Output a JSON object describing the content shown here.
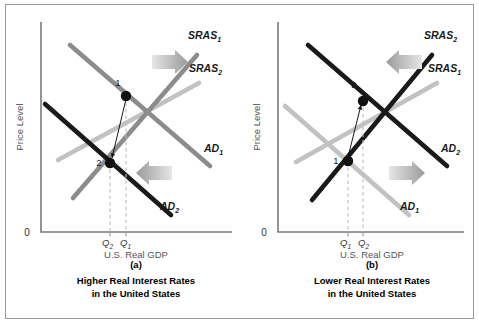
{
  "figure": {
    "width": 479,
    "height": 324,
    "background": "#ffffff",
    "border_color": "#9a9a9a"
  },
  "colors": {
    "near_black": "#1a1a1a",
    "dark_gray": "#4f4f4f",
    "mid_gray": "#8c8c8c",
    "light_gray": "#c2c2c2",
    "axis": "#7a7a7a",
    "guide": "#bdbdbd",
    "point": "#111111",
    "arrow_light": "#e2e2e2",
    "arrow_dark": "#9e9e9e"
  },
  "chart_data": [
    {
      "type": "line",
      "id": "panel-a",
      "title": "Higher Real Interest Rates in the United States",
      "panel_label": "(a)",
      "xlabel": "U.S. Real GDP",
      "ylabel": "Price Level",
      "origin_label": "0",
      "grid": false,
      "legend": "inline-curve-labels",
      "axis_origin_px": {
        "x": 41,
        "y": 232
      },
      "plot_box_px": {
        "x0": 41,
        "y0": 22,
        "x1": 232,
        "y1": 232
      },
      "series": [
        {
          "name": "SRAS1",
          "label": "SRAS",
          "sub": "1",
          "color": "#8c8c8c",
          "width": 4.6,
          "slope": "upward",
          "points_px": [
            [
              73,
              198
            ],
            [
              197,
              55
            ]
          ],
          "label_px": [
            188,
            39
          ]
        },
        {
          "name": "SRAS2",
          "label": "SRAS",
          "sub": "2",
          "color": "#c2c2c2",
          "width": 4.6,
          "slope": "upward",
          "points_px": [
            [
              58,
              160
            ],
            [
              199,
              83
            ]
          ],
          "label_px": [
            189,
            72
          ]
        },
        {
          "name": "AD1",
          "label": "AD",
          "sub": "1",
          "color": "#8c8c8c",
          "width": 4.6,
          "slope": "downward",
          "points_px": [
            [
              70,
              45
            ],
            [
              210,
              166
            ]
          ],
          "label_px": [
            204,
            152
          ]
        },
        {
          "name": "AD2",
          "label": "AD",
          "sub": "2",
          "color": "#1a1a1a",
          "width": 4.6,
          "slope": "downward",
          "points_px": [
            [
              45,
              104
            ],
            [
              171,
              215
            ]
          ],
          "label_px": [
            160,
            210
          ]
        }
      ],
      "equilibria": [
        {
          "label": "1",
          "x_px": 126,
          "y_px": 96,
          "label_px": [
            118,
            86
          ]
        },
        {
          "label": "2",
          "x_px": 110,
          "y_px": 163,
          "label_px": [
            99,
            166
          ]
        }
      ],
      "quantity_ticks": [
        {
          "label": "Q",
          "sub": "2",
          "x_px": 110,
          "text_px": [
            102,
            246
          ]
        },
        {
          "label": "Q",
          "sub": "1",
          "x_px": 126,
          "text_px": [
            120,
            246
          ]
        }
      ],
      "movement_arrow": {
        "from_px": [
          126,
          99
        ],
        "to_px": [
          112,
          158
        ]
      },
      "shift_arrows": [
        {
          "name": "sras-shift-right",
          "direction": "right",
          "x_px": 152,
          "y_px": 62,
          "length": 36,
          "color_from": "#d8d8d8",
          "color_to": "#9e9e9e"
        },
        {
          "name": "ad-shift-left",
          "direction": "left",
          "x_px": 136,
          "y_px": 173,
          "length": 36,
          "color_from": "#d8d8d8",
          "color_to": "#9e9e9e"
        }
      ]
    },
    {
      "type": "line",
      "id": "panel-b",
      "title": "Lower Real Interest Rates in the United States",
      "panel_label": "(b)",
      "xlabel": "U.S. Real GDP",
      "ylabel": "Price Level",
      "origin_label": "0",
      "grid": false,
      "legend": "inline-curve-labels",
      "axis_origin_px": {
        "x": 278,
        "y": 232
      },
      "plot_box_px": {
        "x0": 278,
        "y0": 22,
        "x1": 464,
        "y1": 232
      },
      "series": [
        {
          "name": "SRAS2",
          "label": "SRAS",
          "sub": "2",
          "color": "#1a1a1a",
          "width": 4.6,
          "slope": "upward",
          "points_px": [
            [
              312,
              200
            ],
            [
              432,
              55
            ]
          ],
          "label_px": [
            424,
            39
          ]
        },
        {
          "name": "SRAS1",
          "label": "SRAS",
          "sub": "1",
          "color": "#c2c2c2",
          "width": 4.6,
          "slope": "upward",
          "points_px": [
            [
              296,
              162
            ],
            [
              437,
              83
            ]
          ],
          "label_px": [
            428,
            72
          ]
        },
        {
          "name": "AD1",
          "label": "AD",
          "sub": "1",
          "color": "#c2c2c2",
          "width": 4.6,
          "slope": "downward",
          "points_px": [
            [
              285,
              106
            ],
            [
              409,
              215
            ]
          ],
          "label_px": [
            400,
            210
          ]
        },
        {
          "name": "AD2",
          "label": "AD",
          "sub": "2",
          "color": "#1a1a1a",
          "width": 4.6,
          "slope": "downward",
          "points_px": [
            [
              308,
              45
            ],
            [
              447,
              166
            ]
          ],
          "label_px": [
            441,
            152
          ]
        }
      ],
      "equilibria": [
        {
          "label": "2",
          "x_px": 363,
          "y_px": 101,
          "label_px": [
            354,
            88
          ]
        },
        {
          "label": "1",
          "x_px": 348,
          "y_px": 161,
          "label_px": [
            336,
            164
          ]
        }
      ],
      "quantity_ticks": [
        {
          "label": "Q",
          "sub": "1",
          "x_px": 348,
          "text_px": [
            340,
            246
          ]
        },
        {
          "label": "Q",
          "sub": "2",
          "x_px": 363,
          "text_px": [
            358,
            246
          ]
        }
      ],
      "movement_arrow": {
        "from_px": [
          348,
          157
        ],
        "to_px": [
          361,
          105
        ]
      },
      "shift_arrows": [
        {
          "name": "sras-shift-left",
          "direction": "left",
          "x_px": 386,
          "y_px": 62,
          "length": 36,
          "color_from": "#d8d8d8",
          "color_to": "#9e9e9e"
        },
        {
          "name": "ad-shift-right",
          "direction": "right",
          "x_px": 389,
          "y_px": 173,
          "length": 36,
          "color_from": "#d8d8d8",
          "color_to": "#9e9e9e"
        }
      ]
    }
  ],
  "panels": [
    {
      "id": "a",
      "panel_label": "(a)",
      "caption_line1": "Higher Real Interest Rates",
      "caption_line2": "in the United States",
      "xlabel": "U.S. Real GDP",
      "ylabel": "Price Level",
      "origin_label": "0",
      "panel_label_px": [
        136,
        268
      ],
      "caption1_px": [
        136,
        284
      ],
      "caption2_px": [
        136,
        297
      ],
      "xlabel_px": [
        136,
        258
      ],
      "ylabel_px": [
        23,
        127
      ],
      "origin_px": [
        27,
        236
      ]
    },
    {
      "id": "b",
      "panel_label": "(b)",
      "caption_line1": "Lower Real Interest Rates",
      "caption_line2": "in the United States",
      "xlabel": "U.S. Real GDP",
      "ylabel": "Price Level",
      "origin_label": "0",
      "panel_label_px": [
        372,
        268
      ],
      "caption1_px": [
        372,
        284
      ],
      "caption2_px": [
        372,
        297
      ],
      "xlabel_px": [
        372,
        258
      ],
      "ylabel_px": [
        260,
        127
      ],
      "origin_px": [
        264,
        236
      ]
    }
  ]
}
